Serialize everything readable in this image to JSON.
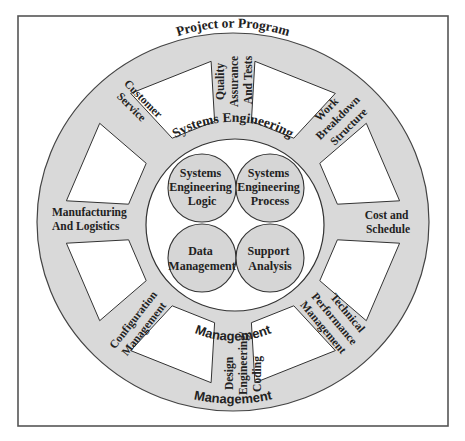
{
  "diagram": {
    "type": "wheel",
    "colors": {
      "frame": "#555555",
      "wheel_fill": "#d9d9d9",
      "wheel_stroke": "#444444",
      "window_fill": "#ffffff",
      "hub_fill": "#ffffff",
      "circle_fill": "#d6d6d6",
      "text": "#222222"
    },
    "rim_labels": {
      "top": "Project or Program",
      "inner_top": "Systems Engineering",
      "inner_bottom": "Management",
      "bottom": "Management"
    },
    "spokes": [
      {
        "id": "quality",
        "lines": [
          "Quality",
          "Assurance",
          "And Tests"
        ]
      },
      {
        "id": "wbs",
        "lines": [
          "Work",
          "Breakdown",
          "Structure"
        ]
      },
      {
        "id": "cost",
        "lines": [
          "Cost and",
          "Schedule"
        ]
      },
      {
        "id": "tpm",
        "lines": [
          "Technical",
          "Performance",
          "Management"
        ]
      },
      {
        "id": "design",
        "lines": [
          "Design",
          "Engineering/",
          "Coding"
        ]
      },
      {
        "id": "config",
        "lines": [
          "Configuration",
          "Management"
        ]
      },
      {
        "id": "manufacturing",
        "lines": [
          "Manufacturing",
          "And Logistics"
        ]
      },
      {
        "id": "customer",
        "lines": [
          "Customer",
          "Service"
        ]
      }
    ],
    "hub_circles": [
      {
        "id": "se-logic",
        "lines": [
          "Systems",
          "Engineering",
          "Logic"
        ]
      },
      {
        "id": "se-process",
        "lines": [
          "Systems",
          "Engineering",
          "Process"
        ]
      },
      {
        "id": "data-mgmt",
        "lines": [
          "Data",
          "Management"
        ]
      },
      {
        "id": "support",
        "lines": [
          "Support",
          "Analysis"
        ]
      }
    ]
  }
}
